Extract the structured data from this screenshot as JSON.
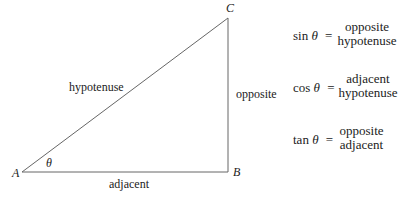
{
  "triangle": {
    "vertices": {
      "A": "A",
      "B": "B",
      "C": "C"
    },
    "angle_label": "θ",
    "sides": {
      "hypotenuse": "hypotenuse",
      "opposite": "opposite",
      "adjacent": "adjacent"
    },
    "stroke_color": "#555555"
  },
  "formulas": [
    {
      "fn": "sin",
      "var": "θ",
      "eq": "=",
      "numerator": "opposite",
      "denominator": "hypotenuse"
    },
    {
      "fn": "cos",
      "var": "θ",
      "eq": "=",
      "numerator": "adjacent",
      "denominator": "hypotenuse"
    },
    {
      "fn": "tan",
      "var": "θ",
      "eq": "=",
      "numerator": "opposite",
      "denominator": "adjacent"
    }
  ]
}
